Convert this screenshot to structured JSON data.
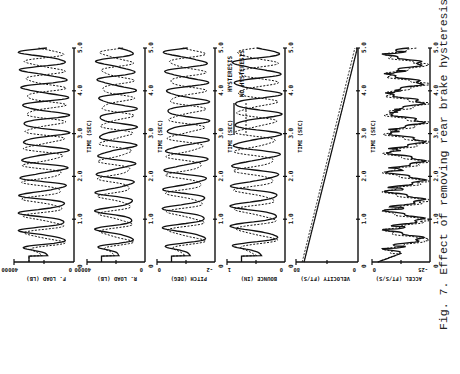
{
  "figure": {
    "caption": "Fig. 7. Effect of removing rear brake hysteresis",
    "time_axis_label": "TIME (SEC)",
    "legend": [
      {
        "label": "HYSTERESIS",
        "style": "solid"
      },
      {
        "label": "NO HYSTERESIS",
        "style": "dashed"
      }
    ]
  },
  "chart_data": {
    "type": "line",
    "title": "Fig. 7. Effect of removing rear brake hysteresis",
    "orientation": "rotated 90 degrees (time axis vertical, increasing upward)",
    "x": {
      "label": "TIME (SEC)",
      "range": [
        0,
        5.0
      ],
      "ticks": [
        "1.0",
        "2.0",
        "3.0",
        "4.0",
        "5.0"
      ]
    },
    "legend_position": "inside panel 4 (bounce), upper region",
    "series_names": [
      "HYSTERESIS",
      "NO HYSTERESIS"
    ],
    "panels": [
      {
        "id": "f_load",
        "ylabel": "F. LOAD (LB)",
        "ylim": [
          0,
          40000
        ],
        "tick_labels": [
          "0",
          "40000"
        ],
        "description": "oscillatory front load, ~2.2 Hz, both series"
      },
      {
        "id": "r_load",
        "ylabel": "R. LOAD (LB)",
        "ylim": [
          0,
          40000
        ],
        "tick_labels": [
          "0",
          "40000"
        ],
        "description": "oscillatory rear load, ~2.2 Hz, both series"
      },
      {
        "id": "pitch",
        "ylabel": "PITCH (DEG)",
        "ylim": [
          -2,
          0
        ],
        "tick_labels": [
          "-2",
          "0"
        ],
        "description": "oscillatory pitch, larger amplitude initially"
      },
      {
        "id": "bounce",
        "ylabel": "BOUNCE (IN)",
        "ylim": [
          0,
          1
        ],
        "tick_labels": [
          "0",
          "1"
        ],
        "description": "oscillatory bounce; solid larger amplitude than dashed"
      },
      {
        "id": "velocity",
        "ylabel": "VELOCITY (FT/S)",
        "ylim": [
          0,
          80
        ],
        "tick_labels": [
          "0",
          "80"
        ],
        "description": "near-linear increase, two nearly parallel lines",
        "series": [
          {
            "name": "HYSTERESIS",
            "x": [
              0,
              5.0
            ],
            "values": [
              12,
              80
            ]
          },
          {
            "name": "NO HYSTERESIS",
            "x": [
              0,
              5.0
            ],
            "values": [
              10,
              76
            ]
          }
        ]
      },
      {
        "id": "accel",
        "ylabel": "ACCEL (FT/S/S)",
        "ylim": [
          -25,
          0
        ],
        "tick_labels": [
          "-25",
          "0"
        ],
        "description": "spiky periodic acceleration oscillation"
      }
    ]
  },
  "panels": [
    {
      "ylabel": "F. LOAD (LB)",
      "lo": "0",
      "hi": "40000"
    },
    {
      "ylabel": "R. LOAD (LB)",
      "lo": "0",
      "hi": "40000"
    },
    {
      "ylabel": "PITCH (DEG)",
      "lo": "-2",
      "hi": "0"
    },
    {
      "ylabel": "BOUNCE (IN)",
      "lo": "0",
      "hi": "1"
    },
    {
      "ylabel": "VELOCITY (FT/S)",
      "lo": "0",
      "hi": "80"
    },
    {
      "ylabel": "ACCEL (FT/S/S)",
      "lo": "-25",
      "hi": "0"
    }
  ],
  "time_ticks": [
    "1.0",
    "2.0",
    "3.0",
    "4.0",
    "5.0"
  ]
}
